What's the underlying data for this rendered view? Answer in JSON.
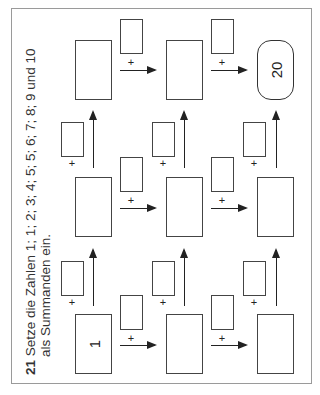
{
  "task": {
    "number": "21",
    "line1": "Setze die Zahlen 1; 1; 2; 3; 4; 5; 5; 6; 7; 8; 9 und 10",
    "line2": "als Summanden ein."
  },
  "grid": {
    "start_value": "1",
    "goal_value": "20",
    "plus_sign": "+",
    "rows": 3,
    "cols": 3
  }
}
